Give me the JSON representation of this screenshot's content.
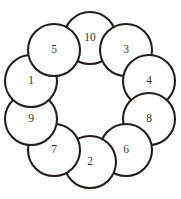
{
  "figure": {
    "kind": "circular-arrangement-of-numbered-circles",
    "background_color": "#ffffff",
    "stroke_color": "#241e1a",
    "label_color": "#3a332e",
    "fill_color": "#ffffff",
    "canvas": {
      "width": 181,
      "height": 199
    },
    "ring": {
      "center_x": 90,
      "center_y": 100,
      "ring_radius": 62,
      "node_radius": 26,
      "node_count": 10,
      "start_angle_deg": -90
    },
    "nodes": [
      {
        "label": "10",
        "cx": 90,
        "cy": 38,
        "r": 26,
        "angle_deg": -90
      },
      {
        "label": "3",
        "cx": 126,
        "cy": 50,
        "r": 26,
        "angle_deg": -54
      },
      {
        "label": "4",
        "cx": 149,
        "cy": 81,
        "r": 26,
        "angle_deg": -18
      },
      {
        "label": "8",
        "cx": 149,
        "cy": 119,
        "r": 26,
        "angle_deg": 18
      },
      {
        "label": "6",
        "cx": 126,
        "cy": 150,
        "r": 26,
        "angle_deg": 54
      },
      {
        "label": "2",
        "cx": 90,
        "cy": 162,
        "r": 26,
        "angle_deg": 90
      },
      {
        "label": "7",
        "cx": 54,
        "cy": 150,
        "r": 26,
        "angle_deg": 126
      },
      {
        "label": "9",
        "cx": 31,
        "cy": 119,
        "r": 26,
        "angle_deg": 162
      },
      {
        "label": "1",
        "cx": 31,
        "cy": 81,
        "r": 26,
        "angle_deg": 198
      },
      {
        "label": "5",
        "cx": 54,
        "cy": 50,
        "r": 26,
        "angle_deg": 234
      }
    ],
    "sequence_clockwise_from_top": [
      "10",
      "3",
      "4",
      "8",
      "6",
      "2",
      "7",
      "9",
      "1",
      "5"
    ]
  }
}
